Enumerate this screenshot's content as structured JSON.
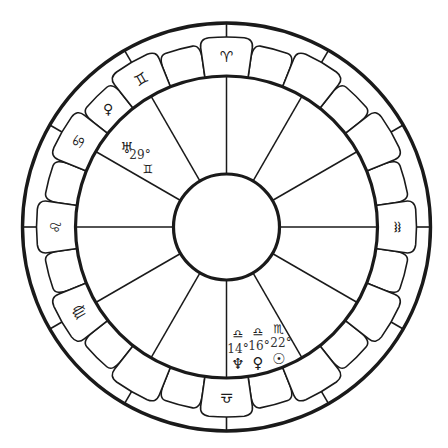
{
  "chart": {
    "center": [
      226.5,
      227
    ],
    "radii": {
      "outer": 204,
      "band_inner": 151,
      "tab_outer": 190,
      "core": 53
    },
    "colors": {
      "ink": "#1a1a1a",
      "background": "#ffffff",
      "text": "#333333"
    },
    "house_cusp_angles_deg": [
      0,
      30,
      60,
      90,
      120,
      150,
      180,
      210,
      240,
      270,
      300,
      330
    ],
    "sign_boxes": [
      {
        "angle": 90,
        "glyph": "♈",
        "name": "aries"
      },
      {
        "angle": 60,
        "glyph": "",
        "name": "empty"
      },
      {
        "angle": 30,
        "glyph": "",
        "name": "empty"
      },
      {
        "angle": 0,
        "glyph": "♒",
        "name": "aquarius"
      },
      {
        "angle": 330,
        "glyph": "",
        "name": "empty"
      },
      {
        "angle": 300,
        "glyph": "",
        "name": "empty"
      },
      {
        "angle": 270,
        "glyph": "♎",
        "name": "libra"
      },
      {
        "angle": 240,
        "glyph": "",
        "name": "empty"
      },
      {
        "angle": 210,
        "glyph": "♍",
        "name": "virgo"
      },
      {
        "angle": 180,
        "glyph": "♌",
        "name": "leo"
      },
      {
        "angle": 150,
        "glyph": "♋",
        "name": "cancer"
      },
      {
        "angle": 120,
        "glyph": "♊",
        "name": "gemini"
      }
    ],
    "bumps": [
      {
        "angle": 105,
        "glyph": ""
      },
      {
        "angle": 75,
        "glyph": ""
      },
      {
        "angle": 45,
        "glyph": ""
      },
      {
        "angle": 15,
        "glyph": ""
      },
      {
        "angle": 345,
        "glyph": ""
      },
      {
        "angle": 315,
        "glyph": ""
      },
      {
        "angle": 285,
        "glyph": ""
      },
      {
        "angle": 255,
        "glyph": ""
      },
      {
        "angle": 225,
        "glyph": ""
      },
      {
        "angle": 195,
        "glyph": ""
      },
      {
        "angle": 165,
        "glyph": ""
      },
      {
        "angle": 135,
        "glyph": "♀",
        "name": "venus"
      }
    ],
    "placements": [
      {
        "planet": "♅",
        "planet_name": "uranus",
        "degree": "29°",
        "sign": "♊",
        "sign_name": "gemini",
        "planet_pos": [
          127,
          148
        ],
        "degree_pos": [
          140,
          155
        ],
        "sign_pos": [
          148,
          169
        ]
      },
      {
        "planet": "♆",
        "planet_name": "neptune",
        "degree": "14°",
        "sign": "♎",
        "sign_name": "libra",
        "sign_pos": [
          238,
          334
        ],
        "degree_pos": [
          238,
          349
        ],
        "planet_pos": [
          238,
          364
        ]
      },
      {
        "planet": "♀",
        "planet_name": "venus",
        "degree": "16°",
        "sign": "♎",
        "sign_name": "libra",
        "sign_pos": [
          258,
          332
        ],
        "degree_pos": [
          259,
          346
        ],
        "planet_pos": [
          258,
          363
        ]
      },
      {
        "planet": "☉",
        "planet_name": "sun",
        "degree": "22°",
        "sign": "♏",
        "sign_name": "scorpio",
        "sign_pos": [
          279,
          329
        ],
        "degree_pos": [
          281,
          343
        ],
        "planet_pos": [
          279,
          359
        ]
      }
    ]
  }
}
